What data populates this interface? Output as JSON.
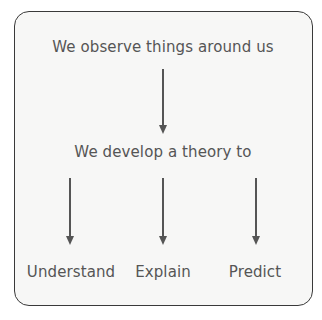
{
  "diagram": {
    "top": "We observe things around us",
    "middle": "We develop a theory to",
    "outcomes": [
      {
        "label": "Understand"
      },
      {
        "label": "Explain"
      },
      {
        "label": "Predict"
      }
    ]
  },
  "colors": {
    "text": "#555555",
    "border": "#3a3a3a",
    "background": "#f7f7f6",
    "arrow": "#555555"
  }
}
